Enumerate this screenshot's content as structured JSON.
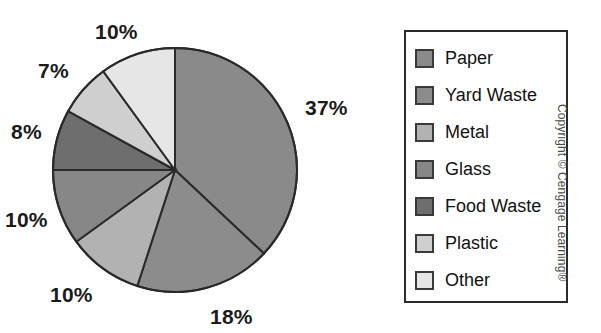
{
  "chart_data": {
    "type": "pie",
    "title": "",
    "subtitle": "",
    "xlabel": "",
    "ylabel": "",
    "grid": false,
    "legend_position": "right",
    "start_angle_deg": 0,
    "direction": "clockwise",
    "center": {
      "x": 175,
      "y": 170
    },
    "radius": 122,
    "categories": [
      "Paper",
      "Yard Waste",
      "Metal",
      "Glass",
      "Food Waste",
      "Plastic",
      "Other"
    ],
    "values": [
      37,
      18,
      10,
      10,
      8,
      7,
      10
    ],
    "value_labels": [
      "37%",
      "18%",
      "10%",
      "10%",
      "8%",
      "7%",
      "10%"
    ],
    "colors": [
      "#8a8a8a",
      "#8c8c8c",
      "#b2b2b2",
      "#878787",
      "#6e6e6e",
      "#cfcfcf",
      "#e6e6e6"
    ],
    "slice_outline_color": "#2a2a2a",
    "slices": [
      {
        "label": "Paper",
        "value": 37,
        "value_label": "37%",
        "color": "#8a8a8a"
      },
      {
        "label": "Yard Waste",
        "value": 18,
        "value_label": "18%",
        "color": "#8c8c8c"
      },
      {
        "label": "Metal",
        "value": 10,
        "value_label": "10%",
        "color": "#b2b2b2"
      },
      {
        "label": "Glass",
        "value": 10,
        "value_label": "10%",
        "color": "#878787"
      },
      {
        "label": "Food Waste",
        "value": 8,
        "value_label": "8%",
        "color": "#6e6e6e"
      },
      {
        "label": "Plastic",
        "value": 7,
        "value_label": "7%",
        "color": "#cfcfcf"
      },
      {
        "label": "Other",
        "value": 10,
        "value_label": "10%",
        "color": "#e6e6e6"
      }
    ]
  },
  "labels": {
    "paper_pct": "37%",
    "yard_waste_pct": "18%",
    "metal_pct": "10%",
    "glass_pct": "10%",
    "food_waste_pct": "8%",
    "plastic_pct": "7%",
    "other_pct": "10%"
  },
  "legend": {
    "items": [
      {
        "label": "Paper",
        "color": "#8a8a8a"
      },
      {
        "label": "Yard Waste",
        "color": "#8c8c8c"
      },
      {
        "label": "Metal",
        "color": "#b2b2b2"
      },
      {
        "label": "Glass",
        "color": "#878787"
      },
      {
        "label": "Food Waste",
        "color": "#6e6e6e"
      },
      {
        "label": "Plastic",
        "color": "#cfcfcf"
      },
      {
        "label": "Other",
        "color": "#e6e6e6"
      }
    ]
  },
  "copyright": {
    "text": "Copyright © Cengage Learning®"
  }
}
